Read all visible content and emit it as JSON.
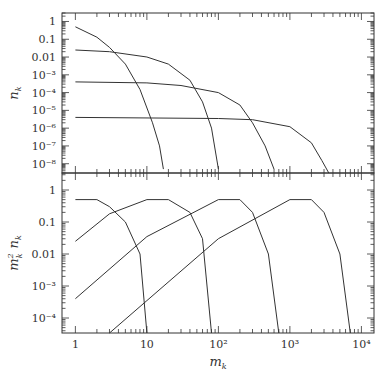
{
  "chart_data": [
    {
      "type": "line",
      "panel": "top",
      "title": "",
      "xlabel": "m_k",
      "ylabel": "n_k",
      "xscale": "log",
      "yscale": "log",
      "xlim": [
        0.65,
        15000
      ],
      "ylim": [
        3e-09,
        3
      ],
      "y_tick_labels": [
        "1",
        "0.1",
        "0.01",
        "10⁻³",
        "10⁻⁴",
        "10⁻⁵",
        "10⁻⁶",
        "10⁻⁷",
        "10⁻⁸"
      ],
      "y_tick_values": [
        1,
        0.1,
        0.01,
        0.001,
        0.0001,
        1e-05,
        1e-06,
        1e-07,
        1e-08
      ],
      "grid": false,
      "legend": null,
      "series": [
        {
          "name": "curve-1",
          "x": [
            1,
            2,
            3,
            5,
            8,
            12,
            15,
            17
          ],
          "values": [
            0.5,
            0.13,
            0.035,
            0.004,
            0.00015,
            2e-06,
            1e-07,
            5e-09
          ]
        },
        {
          "name": "curve-2",
          "x": [
            1,
            3,
            10,
            20,
            40,
            60,
            80,
            100
          ],
          "values": [
            0.025,
            0.02,
            0.01,
            0.004,
            0.0005,
            3e-05,
            1e-06,
            5e-09
          ]
        },
        {
          "name": "curve-3",
          "x": [
            1,
            10,
            30,
            100,
            200,
            300,
            450,
            600
          ],
          "values": [
            0.0004,
            0.00035,
            0.00025,
            0.0001,
            2e-05,
            2e-06,
            1e-07,
            5e-09
          ]
        },
        {
          "name": "curve-4",
          "x": [
            1,
            100,
            300,
            1000,
            2000,
            2800,
            3500
          ],
          "values": [
            4e-06,
            3.5e-06,
            3e-06,
            1.2e-06,
            1.5e-07,
            1.5e-08,
            3e-09
          ]
        }
      ]
    },
    {
      "type": "line",
      "panel": "bottom",
      "title": "",
      "xlabel": "m_k",
      "ylabel": "m_k² n_k",
      "xscale": "log",
      "yscale": "log",
      "xlim": [
        0.65,
        15000
      ],
      "ylim": [
        3.4e-05,
        3.4
      ],
      "x_tick_labels": [
        "1",
        "10",
        "10²",
        "10³",
        "10⁴"
      ],
      "x_tick_values": [
        1,
        10,
        100,
        1000,
        10000
      ],
      "y_tick_labels": [
        "1",
        "0.1",
        "0.01",
        "10⁻³",
        "10⁻⁴"
      ],
      "y_tick_values": [
        1,
        0.1,
        0.01,
        0.001,
        0.0001
      ],
      "grid": false,
      "legend": null,
      "series": [
        {
          "name": "curve-1",
          "x": [
            1,
            2,
            3,
            5,
            8,
            10
          ],
          "values": [
            0.5,
            0.5,
            0.3,
            0.1,
            0.01,
            3.4e-05
          ]
        },
        {
          "name": "curve-2",
          "x": [
            1,
            3,
            10,
            20,
            40,
            60,
            80
          ],
          "values": [
            0.025,
            0.18,
            0.5,
            0.5,
            0.2,
            0.03,
            3.4e-05
          ]
        },
        {
          "name": "curve-3",
          "x": [
            1,
            10,
            100,
            200,
            300,
            500,
            700
          ],
          "values": [
            0.0004,
            0.035,
            0.5,
            0.5,
            0.2,
            0.01,
            3.4e-05
          ]
        },
        {
          "name": "curve-4",
          "x": [
            3,
            10,
            100,
            1000,
            2000,
            3000,
            5000,
            7000
          ],
          "values": [
            3.4e-05,
            0.00035,
            0.03,
            0.5,
            0.5,
            0.2,
            0.01,
            3.4e-05
          ]
        }
      ]
    }
  ],
  "axes": {
    "top_ylabel": "n",
    "top_ylabel_sub": "k",
    "bottom_ylabel_m": "m",
    "bottom_ylabel_sup": "2",
    "bottom_ylabel_sub": "k",
    "bottom_ylabel_n": "n",
    "bottom_ylabel_n_sub": "k",
    "xlabel": "m",
    "xlabel_sub": "k"
  },
  "colors": {
    "line": "#333333",
    "background": "#ffffff"
  }
}
